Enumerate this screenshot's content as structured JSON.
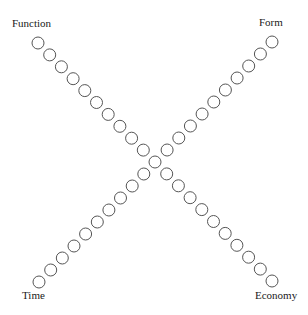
{
  "diagram": {
    "type": "x-cross-of-circles",
    "labels": {
      "top_left": "Function",
      "top_right": "Form",
      "bottom_left": "Time",
      "bottom_right": "Economy"
    },
    "diagonals": [
      {
        "name": "function-to-economy",
        "from": "Function",
        "to": "Economy",
        "circle_count": 21
      },
      {
        "name": "form-to-time",
        "from": "Form",
        "to": "Time",
        "circle_count": 21
      }
    ],
    "shared_center_circle": true,
    "colors": {
      "circle_stroke": "#555555",
      "circle_fill": "#ffffff",
      "text": "#1a1a1a",
      "background": "#ffffff"
    }
  }
}
